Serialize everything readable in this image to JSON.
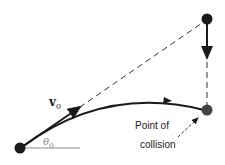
{
  "diagram": {
    "labels": {
      "velocity": "v",
      "velocity_sub": "0",
      "angle": "θ",
      "angle_sub": "0",
      "collision_line1": "Point of",
      "collision_line2": "collision"
    },
    "objects": [
      {
        "name": "projectile",
        "x": 20,
        "y": 148
      },
      {
        "name": "target",
        "x": 207,
        "y": 20
      },
      {
        "name": "collision-point",
        "x": 207,
        "y": 110
      }
    ],
    "colors": {
      "ink": "#1a1a1a",
      "angle_line": "#888888",
      "collision_ball": "#444444"
    }
  }
}
